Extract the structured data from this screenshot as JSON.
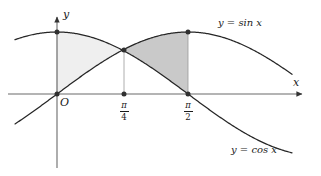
{
  "figure": {
    "background_color": "#ffffff",
    "curve_color": "#262626",
    "axis_color": "#555555",
    "dot_color": "#303030"
  },
  "axes": {
    "x_axis_label": "x",
    "y_axis_label": "y",
    "origin_label": "O",
    "x_axis_y_px": 94,
    "y_axis_x_px": 57,
    "amplitude_px": 62,
    "x_scale_px_per_rad": 83.4,
    "x_axis_tip_px": 305,
    "y_axis_tip_px": 13,
    "y_axis_bottom_px": 168,
    "curve_x_start_px": 15,
    "curve_x_end_px": 292
  },
  "ticks": [
    {
      "name": "pi-over-4",
      "numerator": "π",
      "denominator": "4",
      "x_px": 124,
      "value": 0.7853981634
    },
    {
      "name": "pi-over-2",
      "numerator": "π",
      "denominator": "2",
      "x_px": 188,
      "value": 1.5707963268
    }
  ],
  "curves": [
    {
      "id": "sin",
      "label": "y = sin x",
      "label_x_px": 218,
      "label_y_px": 22,
      "color": "#262626"
    },
    {
      "id": "cos",
      "label": "y = cos x",
      "label_x_px": 231,
      "label_y_px": 149,
      "color": "#262626"
    }
  ],
  "regions": [
    {
      "id": "left-region",
      "name": "region-zero-to-pi-over-4",
      "fill": "#efefef",
      "from": 0.0,
      "to": 0.7853981634,
      "upper": "cos",
      "lower": "sin"
    },
    {
      "id": "right-region",
      "name": "region-pi-over-4-to-pi-over-2",
      "fill": "#c9c9c9",
      "from": 0.7853981634,
      "to": 1.5707963268,
      "upper": "sin",
      "lower": "cos"
    }
  ],
  "points": [
    {
      "name": "point-origin",
      "x_px": 57,
      "y_px": 94,
      "label": "O"
    },
    {
      "name": "point-cos-at-zero",
      "x_px": 57,
      "y_px": 32,
      "label": "(0, 1)"
    },
    {
      "name": "point-intersection",
      "x_px": 124,
      "y_px": 50,
      "label": "(pi/4, sqrt(2)/2)"
    },
    {
      "name": "point-tick-pi-over-4",
      "x_px": 124,
      "y_px": 94,
      "label": "(pi/4, 0)"
    },
    {
      "name": "point-sin-peak",
      "x_px": 188,
      "y_px": 32,
      "label": "(pi/2, 1)"
    },
    {
      "name": "point-tick-pi-over-2",
      "x_px": 188,
      "y_px": 94,
      "label": "(pi/2, 0)"
    }
  ],
  "chart_data": {
    "type": "area",
    "title": "",
    "xlabel": "x",
    "ylabel": "y",
    "xlim": [
      -0.503,
      2.973
    ],
    "ylim": [
      -1.19,
      1.0
    ],
    "grid": false,
    "legend": "inline-curve-labels",
    "x_tick_labels": [
      "π/4",
      "π/2"
    ],
    "x_tick_values": [
      0.7853981634,
      1.5707963268
    ],
    "series": [
      {
        "name": "y = sin x",
        "x": [
          -0.503,
          0.0,
          0.3927,
          0.7854,
          1.1781,
          1.5708,
          1.9635,
          2.3562,
          2.7489,
          2.973
        ],
        "values": [
          -0.482,
          0.0,
          0.3827,
          0.7071,
          0.9239,
          1.0,
          0.9239,
          0.7071,
          0.3827,
          0.1688
        ]
      },
      {
        "name": "y = cos x",
        "x": [
          -0.503,
          0.0,
          0.3927,
          0.7854,
          1.1781,
          1.5708,
          1.9635,
          2.3562,
          2.7489,
          2.973
        ],
        "values": [
          0.8762,
          1.0,
          0.9239,
          0.7071,
          0.3827,
          0.0,
          -0.3827,
          -0.7071,
          -0.9239,
          -0.9857
        ]
      }
    ],
    "shaded_regions": [
      {
        "label": "cos above sin",
        "interval": [
          0.0,
          0.7853981634
        ],
        "fill": "#efefef"
      },
      {
        "label": "sin above cos",
        "interval": [
          0.7853981634,
          1.5707963268
        ],
        "fill": "#c9c9c9"
      }
    ],
    "annotations": [
      "O",
      "π/4",
      "π/2",
      "y = sin x",
      "y = cos x"
    ]
  }
}
